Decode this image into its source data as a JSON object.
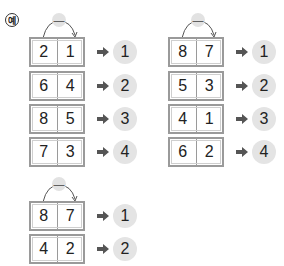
{
  "example_label": "예",
  "colors": {
    "box_border": "#9a9a9a",
    "circle_fill": "#e4e4e4",
    "arrow": "#555555",
    "operator_badge": "#e2e2e2"
  },
  "groups": [
    {
      "operator": "—",
      "rows": [
        {
          "left": "2",
          "right": "1",
          "result": "1"
        },
        {
          "left": "6",
          "right": "4",
          "result": "2"
        },
        {
          "left": "8",
          "right": "5",
          "result": "3"
        },
        {
          "left": "7",
          "right": "3",
          "result": "4"
        }
      ]
    },
    {
      "operator": "—",
      "rows": [
        {
          "left": "8",
          "right": "7",
          "result": "1"
        },
        {
          "left": "5",
          "right": "3",
          "result": "2"
        },
        {
          "left": "4",
          "right": "1",
          "result": "3"
        },
        {
          "left": "6",
          "right": "2",
          "result": "4"
        }
      ]
    },
    {
      "operator": "—",
      "rows": [
        {
          "left": "8",
          "right": "7",
          "result": "1"
        },
        {
          "left": "4",
          "right": "2",
          "result": "2"
        }
      ]
    }
  ]
}
